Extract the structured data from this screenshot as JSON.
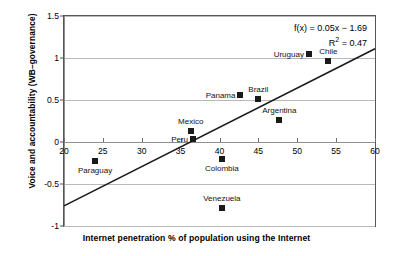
{
  "chart_data": {
    "type": "scatter",
    "title": "",
    "xlabel": "Internet penetration % of population using the Internet",
    "ylabel": "Voice and accountability (WB–governance)",
    "xlim": [
      20,
      60
    ],
    "ylim": [
      -1,
      1.5
    ],
    "xticks": [
      20,
      25,
      30,
      35,
      40,
      45,
      50,
      55,
      60
    ],
    "yticks": [
      -1,
      -0.5,
      0,
      0.5,
      1,
      1.5
    ],
    "xtick_labels": [
      "20",
      "25",
      "30",
      "35",
      "40",
      "45",
      "50",
      "55",
      "60"
    ],
    "ytick_labels": [
      "-1",
      "-0.5",
      "0",
      "0.5",
      "1",
      "1.5"
    ],
    "grid": "horizontal",
    "legend": "none",
    "marker": "filled-square",
    "marker_color": "#1a1a1a",
    "points": [
      {
        "label": "Paraguay",
        "x": 24.0,
        "y": -0.23,
        "label_pos": "below"
      },
      {
        "label": "Mexico",
        "x": 36.3,
        "y": 0.13,
        "label_pos": "above"
      },
      {
        "label": "Peru",
        "x": 36.6,
        "y": 0.03,
        "label_pos": "left"
      },
      {
        "label": "Colombia",
        "x": 40.3,
        "y": -0.2,
        "label_pos": "below"
      },
      {
        "label": "Venezuela",
        "x": 40.3,
        "y": -0.79,
        "label_pos": "above"
      },
      {
        "label": "Panama",
        "x": 42.7,
        "y": 0.56,
        "label_pos": "left"
      },
      {
        "label": "Brazil",
        "x": 45.0,
        "y": 0.51,
        "label_pos": "above"
      },
      {
        "label": "Argentina",
        "x": 47.7,
        "y": 0.26,
        "label_pos": "above"
      },
      {
        "label": "Uruguay",
        "x": 51.5,
        "y": 1.05,
        "label_pos": "left"
      },
      {
        "label": "Chile",
        "x": 54.0,
        "y": 0.97,
        "label_pos": "above"
      }
    ],
    "trendline": {
      "equation_text": "f(x) = 0.05x − 1.69",
      "r2_text": "R² = 0.47",
      "r2_prefix": "R",
      "r2_sup": "2",
      "r2_suffix": " = 0.47",
      "slope": 0.05,
      "intercept": -1.69,
      "r_squared": 0.47,
      "x_start": 20,
      "y_start": -0.76,
      "x_end": 60,
      "y_end": 1.11,
      "color": "#1a1a1a"
    }
  }
}
